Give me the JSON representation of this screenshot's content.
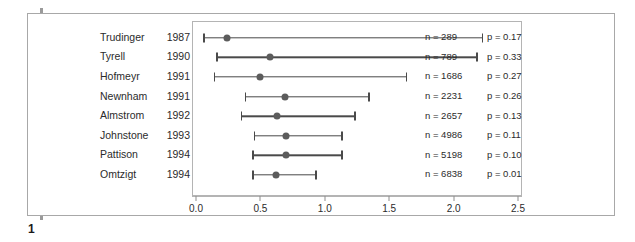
{
  "figure": {
    "number": "1"
  },
  "chart_data": {
    "type": "scatter",
    "subtype": "forest-plot",
    "title": "",
    "xlabel": "",
    "ylabel": "",
    "xlim": [
      0.0,
      2.5
    ],
    "grid": false,
    "legend": null,
    "x_ticks": [
      "0.0",
      "0.5",
      "1.0",
      "1.5",
      "2.0",
      "2.5"
    ],
    "x_tick_values": [
      0.0,
      0.5,
      1.0,
      1.5,
      2.0,
      2.5
    ],
    "columns": [
      "author",
      "year",
      "estimate",
      "ci_low",
      "ci_high",
      "n",
      "p"
    ],
    "rows": [
      {
        "author": "Trudinger",
        "year": "1987",
        "estimate": 0.23,
        "ci_low": 0.05,
        "ci_high": 2.21,
        "n_label": "n = 289",
        "p_label": "p = 0.17",
        "n": 289,
        "p": 0.17
      },
      {
        "author": "Tyrell",
        "year": "1990",
        "estimate": 0.57,
        "ci_low": 0.15,
        "ci_high": 2.17,
        "n_label": "n = 789",
        "p_label": "p = 0.33",
        "n": 789,
        "p": 0.33
      },
      {
        "author": "Hofmeyr",
        "year": "1991",
        "estimate": 0.49,
        "ci_low": 0.13,
        "ci_high": 1.62,
        "n_label": "n = 1686",
        "p_label": "p = 0.27",
        "n": 1686,
        "p": 0.27
      },
      {
        "author": "Newnham",
        "year": "1991",
        "estimate": 0.68,
        "ci_low": 0.37,
        "ci_high": 1.33,
        "n_label": "n = 2231",
        "p_label": "p = 0.26",
        "n": 2231,
        "p": 0.26
      },
      {
        "author": "Almstrom",
        "year": "1992",
        "estimate": 0.62,
        "ci_low": 0.34,
        "ci_high": 1.22,
        "n_label": "n = 2657",
        "p_label": "p = 0.13",
        "n": 2657,
        "p": 0.13
      },
      {
        "author": "Johnstone",
        "year": "1993",
        "estimate": 0.69,
        "ci_low": 0.44,
        "ci_high": 1.12,
        "n_label": "n = 4986",
        "p_label": "p = 0.11",
        "n": 4986,
        "p": 0.11
      },
      {
        "author": "Pattison",
        "year": "1994",
        "estimate": 0.69,
        "ci_low": 0.43,
        "ci_high": 1.12,
        "n_label": "n = 5198",
        "p_label": "p = 0.10",
        "n": 5198,
        "p": 0.1
      },
      {
        "author": "Omtzigt",
        "year": "1994",
        "estimate": 0.61,
        "ci_low": 0.43,
        "ci_high": 0.92,
        "n_label": "n = 6838",
        "p_label": "p = 0.01",
        "n": 6838,
        "p": 0.01
      }
    ]
  },
  "colors": {
    "marker": "#5c5c5c",
    "line": "#4a4a4a",
    "frame": "#b4b4b4",
    "outer_border": "#a8a8a8",
    "accent_bar": "#9a9a9a",
    "text": "#2b2b2b",
    "background": "#ffffff"
  }
}
